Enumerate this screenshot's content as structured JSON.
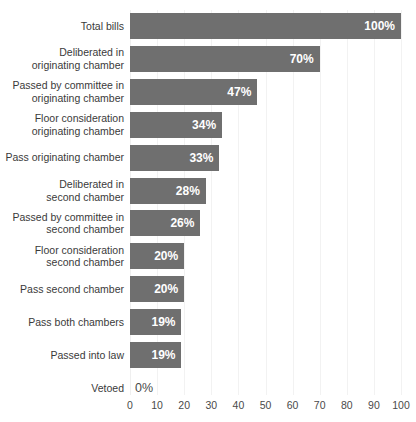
{
  "chart_data": {
    "type": "bar",
    "orientation": "horizontal",
    "title": "",
    "subtitle": "",
    "xlabel": "",
    "ylabel": "",
    "xlim": [
      0,
      100
    ],
    "grid": true,
    "legend": null,
    "bar_color": "#6f6f6f",
    "label_color": "#3a3a3a",
    "value_label_color_inside": "#ffffff",
    "value_label_color_outside": "#4a4a4a",
    "gridline_color": "#f2f2f2",
    "background_color": "#ffffff",
    "xticks": [
      0,
      10,
      20,
      30,
      40,
      50,
      60,
      70,
      80,
      90,
      100
    ],
    "xtick_labels": [
      "0",
      "10",
      "20",
      "30",
      "40",
      "50",
      "60",
      "70",
      "80",
      "90",
      "100"
    ],
    "categories": [
      "Total bills",
      "Deliberated in\noriginating chamber",
      "Passed by committee in\noriginating chamber",
      "Floor consideration\noriginating chamber",
      "Pass originating chamber",
      "Deliberated in\nsecond chamber",
      "Passed by committee in\nsecond chamber",
      "Floor consideration\nsecond chamber",
      "Pass second chamber",
      "Pass both chambers",
      "Passed into law",
      "Vetoed"
    ],
    "values": [
      100,
      70,
      47,
      34,
      33,
      28,
      26,
      20,
      20,
      19,
      19,
      0
    ],
    "data_labels": [
      "100%",
      "70%",
      "47%",
      "34%",
      "33%",
      "28%",
      "26%",
      "20%",
      "20%",
      "19%",
      "19%",
      "0%"
    ]
  }
}
